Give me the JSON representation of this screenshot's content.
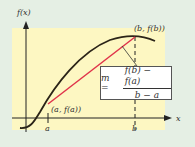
{
  "figure": {
    "y_axis_label": "f(x)",
    "x_axis_label": "x",
    "point_a_tick_label": "a",
    "point_b_tick_label": "b",
    "point_a_label": "(a, f(a))",
    "point_b_label": "(b, f(b))",
    "formula": {
      "lhs": "m =",
      "numerator": "f(b) − f(a)",
      "denominator": "b − a"
    },
    "colors": {
      "background": "#e5efe4",
      "panel": "#fdf7c2",
      "curve": "#2b2418",
      "secant": "#e0334a",
      "axes": "#222222"
    }
  }
}
